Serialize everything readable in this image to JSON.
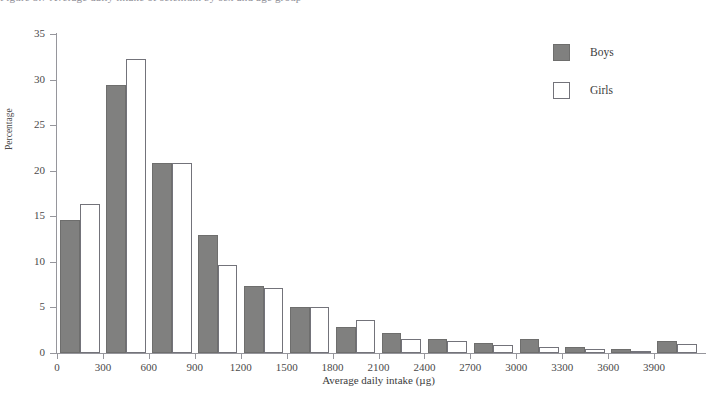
{
  "caption_remnant": "Figure 5.7  Average daily intake of selenium by sex and age group",
  "legend": {
    "position": "top-right",
    "entries": [
      {
        "label": "Boys",
        "swatch": "filled-gray-square",
        "color": "#80807f"
      },
      {
        "label": "Girls",
        "swatch": "open-white-square",
        "color": "#ffffff"
      }
    ]
  },
  "axes": {
    "y_title": "Percentage",
    "x_title": "Average daily intake (µg)",
    "y_ticks": [
      0,
      5,
      10,
      15,
      20,
      25,
      30,
      35
    ],
    "x_ticks": [
      0,
      300,
      600,
      900,
      1200,
      1500,
      1800,
      2100,
      2400,
      2700,
      3000,
      3300,
      3600,
      3900
    ],
    "ylim": [
      0,
      35
    ],
    "xlim": [
      0,
      4200
    ],
    "grid": false
  },
  "chart_data": {
    "type": "bar",
    "title": "",
    "subtitle": "",
    "xlabel": "Average daily intake (µg)",
    "ylabel": "Percentage",
    "ylim": [
      0,
      35
    ],
    "xlim": [
      0,
      4200
    ],
    "grid": false,
    "legend_position": "top-right",
    "bin_width": 300,
    "categories": [
      "0-300",
      "300-600",
      "600-900",
      "900-1200",
      "1200-1500",
      "1500-1800",
      "1800-2100",
      "2100-2400",
      "2400-2700",
      "2700-3000",
      "3000-3300",
      "3300-3600",
      "3600-3900",
      "3900-4200"
    ],
    "bin_starts": [
      0,
      300,
      600,
      900,
      1200,
      1500,
      1800,
      2100,
      2400,
      2700,
      3000,
      3300,
      3600,
      3900
    ],
    "series": [
      {
        "name": "Boys",
        "color": "#80807f",
        "values": [
          14.6,
          29.4,
          20.9,
          12.9,
          7.3,
          5.0,
          2.9,
          2.2,
          1.5,
          1.1,
          1.5,
          0.7,
          0.4,
          1.3
        ]
      },
      {
        "name": "Girls",
        "color": "#ffffff",
        "values": [
          16.3,
          32.3,
          20.8,
          9.7,
          7.1,
          5.1,
          3.6,
          1.5,
          1.3,
          0.9,
          0.7,
          0.4,
          0.1,
          1.0
        ]
      }
    ]
  }
}
